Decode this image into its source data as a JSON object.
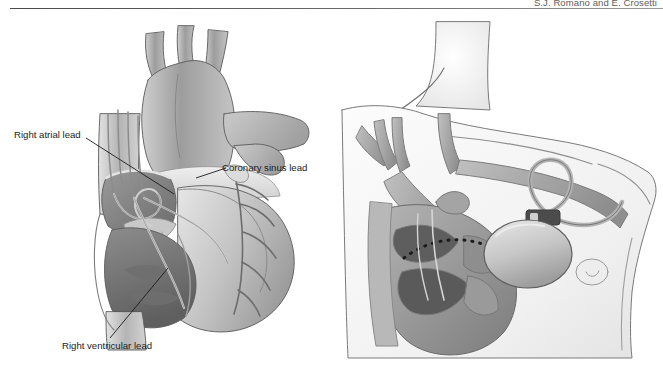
{
  "header": {
    "running_head": "S.J. Romano and E. Crosetti"
  },
  "figure": {
    "background_color": "#ffffff",
    "ink_color": "#4a4a4a"
  },
  "callouts": [
    {
      "id": "right-atrial-lead",
      "label": "Right atrial lead",
      "panel": "left",
      "leader": "down-right"
    },
    {
      "id": "coronary-sinus-lead",
      "label": "Coronary sinus lead",
      "panel": "left",
      "leader": "up-left"
    },
    {
      "id": "right-ventricular-lead",
      "label": "Right ventricular lead",
      "panel": "left",
      "leader": "up-right"
    }
  ],
  "panels": {
    "left": {
      "name": "heart-cutaway-diagram",
      "description": "Anterior cutaway view of the heart showing aortic arch, superior vena cava, right atrium, right ventricle and coronary vessels with three pacing leads in place",
      "structures": [
        "aortic arch",
        "brachiocephalic vessels",
        "superior vena cava",
        "pulmonary artery",
        "right atrium",
        "right ventricle",
        "left ventricle",
        "tricuspid valve",
        "coronary sinus",
        "coronary arteries",
        "inferior vena cava"
      ]
    },
    "right": {
      "name": "torso-implant-diagram",
      "description": "Upper torso showing pulse generator implanted in a left infraclavicular pocket with leads routed through the subclavian vein into the heart",
      "structures": [
        "neck",
        "clavicle",
        "shoulder",
        "subclavian vein",
        "jugular vein",
        "brachiocephalic vein",
        "pulse generator",
        "lead loop",
        "heart cutaway",
        "nipple",
        "rib contour"
      ]
    }
  },
  "colors": {
    "outline": "#4a4a4a",
    "tissue_light": "#d8d8d8",
    "tissue_mid": "#a8a8a8",
    "tissue_dark": "#6f6f6f",
    "chamber_dark": "#5a5a5a",
    "skin_tint": "#f2f2f2",
    "device_body": "#c9c9c9",
    "lead_wire": "#8a8a8a",
    "label_text": "#1c1c1c",
    "rule": "#5a5a5a"
  }
}
